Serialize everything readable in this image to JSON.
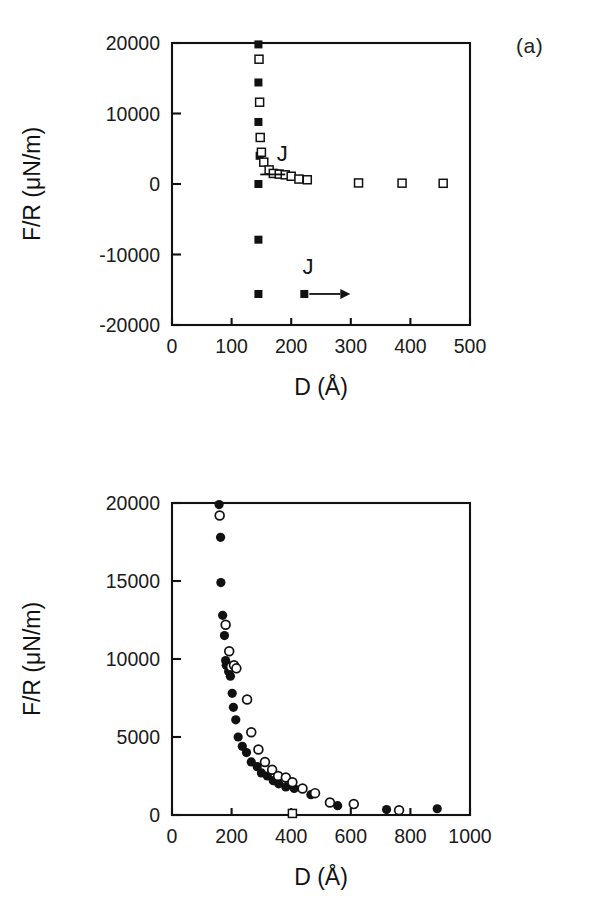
{
  "figure": {
    "panel_a_tag": "(a)",
    "panel_b_tag": "(b)"
  },
  "chart_data": [
    {
      "id": "panel-a",
      "type": "scatter",
      "title": "",
      "panel_label": "(a)",
      "xlabel": "D (Å)",
      "ylabel": "F/R (μN/m)",
      "xlim": [
        0,
        500
      ],
      "ylim": [
        -20000,
        20000
      ],
      "xticks": [
        0,
        100,
        200,
        300,
        400,
        500
      ],
      "xticklabels": [
        "0",
        "100",
        "200",
        "300",
        "400",
        "500"
      ],
      "yticks": [
        -20000,
        -10000,
        0,
        10000,
        20000
      ],
      "yticklabels": [
        "-20000",
        "-10000",
        "0",
        "10000",
        "20000"
      ],
      "grid": false,
      "legend": "none",
      "series": [
        {
          "name": "filled-squares",
          "marker": "filled-square",
          "points": [
            [
              145,
              19800
            ],
            [
              145,
              14400
            ],
            [
              145,
              8800
            ],
            [
              147,
              4000
            ],
            [
              177,
              1500
            ],
            [
              145,
              0
            ],
            [
              145,
              -7900
            ],
            [
              145,
              -15600
            ]
          ]
        },
        {
          "name": "open-squares",
          "marker": "open-square",
          "points": [
            [
              146,
              17700
            ],
            [
              147,
              11600
            ],
            [
              148,
              6600
            ],
            [
              150,
              4500
            ],
            [
              154,
              3100
            ],
            [
              163,
              2000
            ],
            [
              170,
              1500
            ],
            [
              180,
              1400
            ],
            [
              190,
              1300
            ],
            [
              200,
              1100
            ],
            [
              213,
              700
            ],
            [
              227,
              600
            ],
            [
              313,
              150
            ],
            [
              386,
              120
            ],
            [
              455,
              100
            ]
          ]
        }
      ],
      "annotations": [
        {
          "name": "jump-label-upper",
          "text": "J",
          "x": 185,
          "y": 3200,
          "has_hook": true,
          "hook_direction": "left"
        },
        {
          "name": "jump-label-lower",
          "text": "J",
          "x": 228,
          "y": -12700,
          "has_arrow": true,
          "arrow_direction": "right",
          "marker": "filled-square",
          "marker_x": 222,
          "marker_y": -15600
        }
      ]
    },
    {
      "id": "panel-b",
      "type": "scatter",
      "title": "",
      "panel_label": "(b)",
      "xlabel": "D (Å)",
      "ylabel": "F/R (μN/m)",
      "xlim": [
        0,
        1000
      ],
      "ylim": [
        0,
        20000
      ],
      "xticks": [
        0,
        200,
        400,
        600,
        800,
        1000
      ],
      "xticklabels": [
        "0",
        "200",
        "400",
        "600",
        "800",
        "1000"
      ],
      "yticks": [
        0,
        5000,
        10000,
        15000,
        20000
      ],
      "yticklabels": [
        "0",
        "5000",
        "10000",
        "15000",
        "20000"
      ],
      "grid": false,
      "legend": "none",
      "series": [
        {
          "name": "filled-circles",
          "marker": "filled-circle",
          "points": [
            [
              158,
              19900
            ],
            [
              163,
              17800
            ],
            [
              164,
              14900
            ],
            [
              170,
              12800
            ],
            [
              176,
              11500
            ],
            [
              180,
              9900
            ],
            [
              182,
              9600
            ],
            [
              190,
              9200
            ],
            [
              196,
              8900
            ],
            [
              202,
              7800
            ],
            [
              206,
              6900
            ],
            [
              214,
              6100
            ],
            [
              222,
              5000
            ],
            [
              236,
              4400
            ],
            [
              250,
              4000
            ],
            [
              266,
              3400
            ],
            [
              286,
              3100
            ],
            [
              300,
              2700
            ],
            [
              320,
              2500
            ],
            [
              340,
              2200
            ],
            [
              358,
              2000
            ],
            [
              382,
              1800
            ],
            [
              410,
              1700
            ],
            [
              466,
              1300
            ],
            [
              556,
              600
            ],
            [
              720,
              350
            ],
            [
              890,
              400
            ]
          ]
        },
        {
          "name": "open-circles",
          "marker": "open-circle",
          "points": [
            [
              160,
              19200
            ],
            [
              180,
              12200
            ],
            [
              192,
              10500
            ],
            [
              198,
              9500
            ],
            [
              208,
              9600
            ],
            [
              216,
              9400
            ],
            [
              252,
              7400
            ],
            [
              266,
              5300
            ],
            [
              290,
              4200
            ],
            [
              312,
              3400
            ],
            [
              336,
              2900
            ],
            [
              356,
              2500
            ],
            [
              382,
              2400
            ],
            [
              404,
              2100
            ],
            [
              438,
              1700
            ],
            [
              480,
              1400
            ],
            [
              530,
              800
            ],
            [
              610,
              700
            ],
            [
              762,
              300
            ]
          ]
        },
        {
          "name": "open-square-outlier",
          "marker": "open-square",
          "points": [
            [
              404,
              100
            ]
          ]
        }
      ],
      "annotations": []
    }
  ]
}
